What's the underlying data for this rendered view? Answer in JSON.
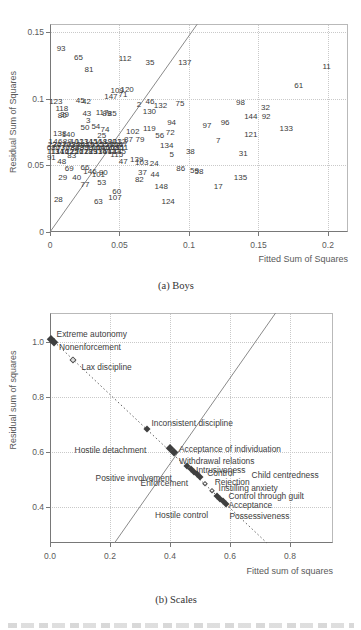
{
  "chart_data": [
    {
      "id": "boys",
      "type": "scatter",
      "caption": "(a) Boys",
      "xlabel": "Fitted Sum of Squares",
      "ylabel": "Residual Sum of Squares",
      "xlim": [
        0,
        0.2144
      ],
      "ylim": [
        0,
        0.156
      ],
      "grid": "dotted",
      "xticks": {
        "values": [
          0,
          0.05,
          0.1,
          0.15,
          0.2
        ],
        "labels": [
          "0",
          "0.05",
          "0.1",
          "0.15",
          "0.2"
        ]
      },
      "yticks": {
        "values": [
          0,
          0.05,
          0.1,
          0.15
        ],
        "labels": [
          "0",
          "0.05",
          "0.1",
          "0.15"
        ]
      },
      "lines": [
        {
          "style": "solid",
          "from": [
            0,
            0
          ],
          "to": [
            0.106,
            0.156
          ]
        }
      ],
      "marker": "case-number",
      "points": [
        [
          "93",
          0.008,
          0.1375
        ],
        [
          "65",
          0.0205,
          0.1305
        ],
        [
          "81",
          0.028,
          0.1215
        ],
        [
          "112",
          0.054,
          0.13
        ],
        [
          "35",
          0.072,
          0.1265
        ],
        [
          "137",
          0.097,
          0.1265
        ],
        [
          "11",
          0.199,
          0.1235
        ],
        [
          "61",
          0.179,
          0.1095
        ],
        [
          "120",
          0.0555,
          0.1068
        ],
        [
          "109",
          0.0483,
          0.1058
        ],
        [
          "71",
          0.0525,
          0.1028
        ],
        [
          "147",
          0.0438,
          0.1012
        ],
        [
          "45",
          0.0218,
          0.0985
        ],
        [
          "42",
          0.0262,
          0.0975
        ],
        [
          "123",
          0.0042,
          0.0978
        ],
        [
          "118",
          0.0085,
          0.0922
        ],
        [
          "80",
          0.0088,
          0.0872
        ],
        [
          "39",
          0.0105,
          0.0878
        ],
        [
          "43",
          0.0265,
          0.0885
        ],
        [
          "3",
          0.0275,
          0.0832
        ],
        [
          "2",
          0.064,
          0.095
        ],
        [
          "46",
          0.072,
          0.0978
        ],
        [
          "132",
          0.0795,
          0.0942
        ],
        [
          "75",
          0.0935,
          0.0962
        ],
        [
          "130",
          0.0715,
          0.09
        ],
        [
          "85",
          0.0448,
          0.0885
        ],
        [
          "89",
          0.0408,
          0.0888
        ],
        [
          "117",
          0.0375,
          0.0892
        ],
        [
          "98",
          0.137,
          0.0968
        ],
        [
          "32",
          0.155,
          0.0928
        ],
        [
          "144",
          0.1445,
          0.0865
        ],
        [
          "92",
          0.1555,
          0.0865
        ],
        [
          "133",
          0.17,
          0.0772
        ],
        [
          "121",
          0.1445,
          0.0727
        ],
        [
          "96",
          0.126,
          0.0815
        ],
        [
          "97",
          0.113,
          0.0792
        ],
        [
          "7",
          0.121,
          0.068
        ],
        [
          "94",
          0.0875,
          0.0815
        ],
        [
          "119",
          0.0715,
          0.0775
        ],
        [
          "102",
          0.0595,
          0.075
        ],
        [
          "87",
          0.0565,
          0.069
        ],
        [
          "79",
          0.0648,
          0.0692
        ],
        [
          "56",
          0.079,
          0.072
        ],
        [
          "72",
          0.0865,
          0.074
        ],
        [
          "50",
          0.0252,
          0.0782
        ],
        [
          "54",
          0.033,
          0.0785
        ],
        [
          "74",
          0.0396,
          0.0767
        ],
        [
          "138",
          0.007,
          0.0735
        ],
        [
          "140",
          0.0132,
          0.0725
        ],
        [
          "25",
          0.0372,
          0.0717
        ],
        [
          "31",
          0.139,
          0.0585
        ],
        [
          "38",
          0.101,
          0.0598
        ],
        [
          "5",
          0.0875,
          0.0577
        ],
        [
          "134",
          0.084,
          0.0648
        ],
        [
          "135",
          0.137,
          0.0407
        ],
        [
          "17",
          0.121,
          0.034
        ],
        [
          "86",
          0.094,
          0.047
        ],
        [
          "59",
          0.104,
          0.0455
        ],
        [
          "58",
          0.1072,
          0.0448
        ],
        [
          "24",
          0.075,
          0.0507
        ],
        [
          "44",
          0.0755,
          0.0427
        ],
        [
          "148",
          0.08,
          0.034
        ],
        [
          "124",
          0.085,
          0.0227
        ],
        [
          "37",
          0.0665,
          0.044
        ],
        [
          "82",
          0.0643,
          0.039
        ],
        [
          "103",
          0.066,
          0.0515
        ],
        [
          "139",
          0.0624,
          0.054
        ],
        [
          "47",
          0.0527,
          0.0527
        ],
        [
          "115",
          0.048,
          0.0577
        ],
        [
          "60",
          0.048,
          0.0302
        ],
        [
          "107",
          0.0468,
          0.0253
        ],
        [
          "63",
          0.0348,
          0.0227
        ],
        [
          "28",
          0.006,
          0.024
        ],
        [
          "29",
          0.0091,
          0.0403
        ],
        [
          "40",
          0.0192,
          0.0403
        ],
        [
          "77",
          0.0252,
          0.0353
        ],
        [
          "53",
          0.0372,
          0.0365
        ],
        [
          "90",
          0.0384,
          0.044
        ],
        [
          "146",
          0.0288,
          0.0452
        ],
        [
          "101",
          0.0348,
          0.0427
        ],
        [
          "66",
          0.0252,
          0.0478
        ],
        [
          "69",
          0.0139,
          0.047
        ],
        [
          "48",
          0.0084,
          0.0527
        ],
        [
          "83",
          0.0156,
          0.057
        ],
        [
          "91",
          0.001,
          0.0555
        ],
        [
          "1",
          0.0006,
          0.0678
        ],
        [
          "4",
          0.004,
          0.0678
        ],
        [
          "6",
          0.0074,
          0.0678
        ],
        [
          "8",
          0.0108,
          0.0678
        ],
        [
          "9",
          0.0142,
          0.0678
        ],
        [
          "10",
          0.0176,
          0.0678
        ],
        [
          "12",
          0.021,
          0.0678
        ],
        [
          "13",
          0.0244,
          0.0678
        ],
        [
          "14",
          0.0278,
          0.0678
        ],
        [
          "15",
          0.0312,
          0.0678
        ],
        [
          "16",
          0.0346,
          0.0678
        ],
        [
          "18",
          0.038,
          0.0678
        ],
        [
          "19",
          0.0414,
          0.0678
        ],
        [
          "20",
          0.0448,
          0.0678
        ],
        [
          "21",
          0.0482,
          0.0678
        ],
        [
          "22",
          0.0516,
          0.0678
        ],
        [
          "23",
          0.0016,
          0.0654
        ],
        [
          "26",
          0.005,
          0.0654
        ],
        [
          "27",
          0.0084,
          0.0654
        ],
        [
          "30",
          0.0118,
          0.0654
        ],
        [
          "33",
          0.0152,
          0.0654
        ],
        [
          "34",
          0.0186,
          0.0654
        ],
        [
          "36",
          0.022,
          0.0654
        ],
        [
          "41",
          0.0254,
          0.0654
        ],
        [
          "49",
          0.0288,
          0.0654
        ],
        [
          "51",
          0.0322,
          0.0654
        ],
        [
          "52",
          0.0356,
          0.0654
        ],
        [
          "55",
          0.039,
          0.0654
        ],
        [
          "57",
          0.0424,
          0.0654
        ],
        [
          "62",
          0.0458,
          0.0654
        ],
        [
          "64",
          0.0492,
          0.0654
        ],
        [
          "67",
          0.0526,
          0.0654
        ],
        [
          "68",
          0.0009,
          0.0631
        ],
        [
          "70",
          0.0043,
          0.0631
        ],
        [
          "73",
          0.0077,
          0.0631
        ],
        [
          "76",
          0.0111,
          0.0631
        ],
        [
          "78",
          0.0145,
          0.0631
        ],
        [
          "84",
          0.0179,
          0.0631
        ],
        [
          "88",
          0.0213,
          0.0631
        ],
        [
          "95",
          0.0247,
          0.0631
        ],
        [
          "99",
          0.0281,
          0.0631
        ],
        [
          "100",
          0.0315,
          0.0631
        ],
        [
          "104",
          0.0349,
          0.0631
        ],
        [
          "105",
          0.0383,
          0.0631
        ],
        [
          "106",
          0.0417,
          0.0631
        ],
        [
          "108",
          0.0451,
          0.0631
        ],
        [
          "110",
          0.0485,
          0.0631
        ],
        [
          "111",
          0.0519,
          0.0631
        ],
        [
          "113",
          0.0022,
          0.0602
        ],
        [
          "114",
          0.0056,
          0.0602
        ],
        [
          "116",
          0.009,
          0.0602
        ],
        [
          "122",
          0.0124,
          0.0602
        ],
        [
          "125",
          0.0158,
          0.0602
        ],
        [
          "126",
          0.0192,
          0.0602
        ],
        [
          "127",
          0.0226,
          0.0602
        ],
        [
          "128",
          0.026,
          0.0602
        ],
        [
          "129",
          0.0294,
          0.0602
        ],
        [
          "131",
          0.0328,
          0.0602
        ],
        [
          "136",
          0.0362,
          0.0602
        ],
        [
          "141",
          0.0396,
          0.0602
        ],
        [
          "142",
          0.043,
          0.0602
        ],
        [
          "143",
          0.0464,
          0.0602
        ],
        [
          "145",
          0.0498,
          0.0602
        ]
      ]
    },
    {
      "id": "scales",
      "type": "scatter",
      "caption": "(b) Scales",
      "xlabel": "Fitted sum of squares",
      "ylabel": "Residual sum of squares",
      "xlim": [
        0,
        0.9433
      ],
      "ylim": [
        0.2689,
        1.1074
      ],
      "grid": "dotted",
      "xticks": {
        "values": [
          0,
          0.2,
          0.4,
          0.6,
          0.8
        ],
        "labels": [
          "0.0",
          "0.2",
          "0.4",
          "0.6",
          "0.8"
        ]
      },
      "yticks": {
        "values": [
          0.4,
          0.6,
          0.8,
          1.0
        ],
        "labels": [
          "0.4",
          "0.6",
          "0.8",
          "1.0"
        ]
      },
      "lines": [
        {
          "style": "solid",
          "from": [
            0.215,
            0.2689
          ],
          "to": [
            0.752,
            1.1074
          ]
        },
        {
          "style": "dotted",
          "from": [
            0.004,
            1.013
          ],
          "to": [
            0.723,
            0.2689
          ]
        }
      ],
      "marker": "diamond",
      "diamonds": [
        [
          0.004,
          1.012,
          1,
          8
        ],
        [
          0.013,
          1.002,
          1,
          8
        ],
        [
          0.075,
          0.935,
          0,
          7
        ],
        [
          0.322,
          0.686,
          1,
          7
        ],
        [
          0.4,
          0.614,
          1,
          8
        ],
        [
          0.414,
          0.601,
          1,
          8
        ],
        [
          0.456,
          0.549,
          1,
          7
        ],
        [
          0.47,
          0.537,
          1,
          7
        ],
        [
          0.48,
          0.528,
          1,
          7
        ],
        [
          0.49,
          0.519,
          1,
          7
        ],
        [
          0.499,
          0.51,
          1,
          7
        ],
        [
          0.515,
          0.484,
          0,
          6
        ],
        [
          0.54,
          0.458,
          0,
          6
        ],
        [
          0.556,
          0.44,
          1,
          7
        ],
        [
          0.566,
          0.431,
          1,
          7
        ],
        [
          0.577,
          0.421,
          1,
          7
        ],
        [
          0.588,
          0.412,
          1,
          7
        ]
      ],
      "point_labels": [
        [
          "Extreme autonomy",
          0.022,
          1.032
        ],
        [
          "Nonenforcement",
          0.03,
          0.982
        ],
        [
          "Lax discipline",
          0.105,
          0.912
        ],
        [
          "Inconsistent discipline",
          0.338,
          0.706
        ],
        [
          "Hostile detachment",
          0.082,
          0.608
        ],
        [
          "Acceptance of individuation",
          0.43,
          0.61
        ],
        [
          "Withdrawal relations",
          0.43,
          0.569
        ],
        [
          "Intrusiveness",
          0.487,
          0.536
        ],
        [
          "Control",
          0.524,
          0.523
        ],
        [
          "Child centredness",
          0.672,
          0.518
        ],
        [
          "Positive involvement",
          0.152,
          0.506
        ],
        [
          "Enforcement",
          0.302,
          0.488
        ],
        [
          "Rejection",
          0.549,
          0.492
        ],
        [
          "Instilling anxiety",
          0.562,
          0.468
        ],
        [
          "Control through guilt",
          0.595,
          0.44
        ],
        [
          "Acceptance",
          0.595,
          0.408
        ],
        [
          "Hostile control",
          0.35,
          0.372
        ],
        [
          "Possessiveness",
          0.598,
          0.366
        ]
      ]
    }
  ],
  "colors": {
    "marker": "#3f3f3f",
    "text": "#3a3a3a",
    "axis": "#787878",
    "grid": "#c9c9c9",
    "solid_line": "#8a8a8a",
    "dotted_line": "#5f5f5f"
  }
}
